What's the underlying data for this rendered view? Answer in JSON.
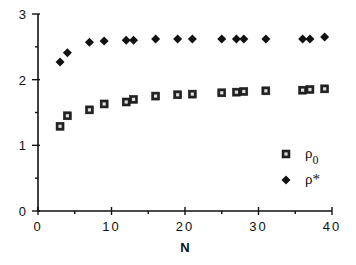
{
  "chart_data": {
    "type": "scatter",
    "title": "",
    "xlabel": "N",
    "ylabel": "",
    "xlim": [
      0,
      40
    ],
    "ylim": [
      0,
      3
    ],
    "x_ticks": [
      "0",
      "10",
      "20",
      "30",
      "40"
    ],
    "y_ticks": [
      "0",
      "1",
      "2",
      "3"
    ],
    "grid": false,
    "legend_position": "lower right",
    "series": [
      {
        "name": "ρ0",
        "label_main": "ρ",
        "label_sub": "0",
        "marker": "square-open",
        "x": [
          3,
          4,
          7,
          9,
          12,
          13,
          16,
          19,
          21,
          25,
          27,
          28,
          31,
          36,
          37,
          39
        ],
        "values": [
          1.29,
          1.45,
          1.54,
          1.63,
          1.66,
          1.7,
          1.75,
          1.77,
          1.78,
          1.8,
          1.81,
          1.82,
          1.83,
          1.84,
          1.85,
          1.86
        ]
      },
      {
        "name": "ρ*",
        "label_main": "ρ*",
        "label_sub": "",
        "marker": "diamond-filled",
        "x": [
          3,
          4,
          7,
          9,
          12,
          13,
          16,
          19,
          21,
          25,
          27,
          28,
          31,
          36,
          37,
          39
        ],
        "values": [
          2.27,
          2.41,
          2.57,
          2.59,
          2.6,
          2.6,
          2.62,
          2.62,
          2.62,
          2.62,
          2.62,
          2.62,
          2.62,
          2.62,
          2.62,
          2.65
        ]
      }
    ]
  }
}
